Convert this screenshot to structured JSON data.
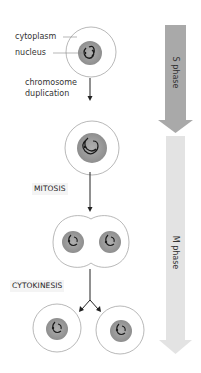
{
  "diagram": {
    "labels": {
      "cytoplasm": "cytoplasm",
      "nucleus": "nucleus",
      "chromosome_duplication_line1": "chromosome",
      "chromosome_duplication_line2": "duplication",
      "mitosis": "MITOSIS",
      "cytokinesis": "CYTOKINESIS"
    },
    "phases": [
      {
        "label": "S phase",
        "color": "#a9a9a9"
      },
      {
        "label": "M phase",
        "color": "#e3e3e3"
      }
    ],
    "colors": {
      "cell_outline": "#9a9a9a",
      "nucleus_fill": "#9c9c9c",
      "chromosome": "#1a1a1a",
      "arrow": "#222222"
    }
  }
}
